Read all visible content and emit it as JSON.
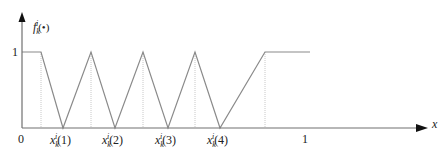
{
  "diagram": {
    "type": "membership-function-plot",
    "y_axis": {
      "label_main": "f",
      "label_sub": "k",
      "label_sup": "i",
      "label_arg": "(•)",
      "tick_1": "1"
    },
    "x_axis": {
      "label": "x",
      "origin": "0",
      "tick_1": "1",
      "points": [
        {
          "main": "x",
          "sub": "k",
          "sup": "i",
          "arg": "(1)"
        },
        {
          "main": "x",
          "sub": "k",
          "sup": "i",
          "arg": "(2)"
        },
        {
          "main": "x",
          "sub": "k",
          "sup": "i",
          "arg": "(3)"
        },
        {
          "main": "x",
          "sub": "k",
          "sup": "i",
          "arg": "(4)"
        }
      ]
    },
    "colors": {
      "axis": "#707070",
      "curve": "#8a8a8a",
      "dotted": "#c8c8c8",
      "text": "#222222"
    }
  }
}
